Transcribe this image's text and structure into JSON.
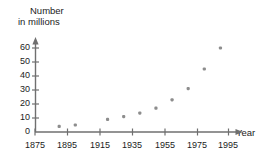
{
  "chart_data": {
    "type": "scatter",
    "title": "",
    "subtitle": "",
    "xlabel": "Year",
    "ylabel": "Number in millions",
    "ylabel_lines": [
      "Number",
      "in millions"
    ],
    "xlim": [
      1875,
      1999
    ],
    "ylim": [
      0,
      65
    ],
    "x_ticks": [
      1875,
      1895,
      1915,
      1935,
      1955,
      1975,
      1995
    ],
    "x_tick_labels": [
      "1875",
      "1895",
      "1915",
      "1935",
      "1955",
      "1975",
      "1995"
    ],
    "y_ticks": [
      0,
      10,
      20,
      30,
      40,
      50,
      60
    ],
    "y_tick_labels": [
      "0",
      "10",
      "20",
      "30",
      "40",
      "50",
      "60"
    ],
    "grid": false,
    "legend": null,
    "x": [
      1890,
      1900,
      1920,
      1930,
      1940,
      1950,
      1960,
      1970,
      1980,
      1990
    ],
    "values": [
      4,
      5,
      9,
      11,
      13.5,
      17,
      23,
      31,
      45,
      60
    ],
    "points": [
      {
        "x": 1890,
        "y": 4
      },
      {
        "x": 1900,
        "y": 5
      },
      {
        "x": 1920,
        "y": 9
      },
      {
        "x": 1930,
        "y": 11
      },
      {
        "x": 1940,
        "y": 13.5
      },
      {
        "x": 1950,
        "y": 17
      },
      {
        "x": 1960,
        "y": 23
      },
      {
        "x": 1970,
        "y": 31
      },
      {
        "x": 1980,
        "y": 45
      },
      {
        "x": 1990,
        "y": 60
      }
    ],
    "marker_color": "#8d8d8d",
    "axis_color": "#6f6f6f",
    "background_color": "#ffffff"
  }
}
